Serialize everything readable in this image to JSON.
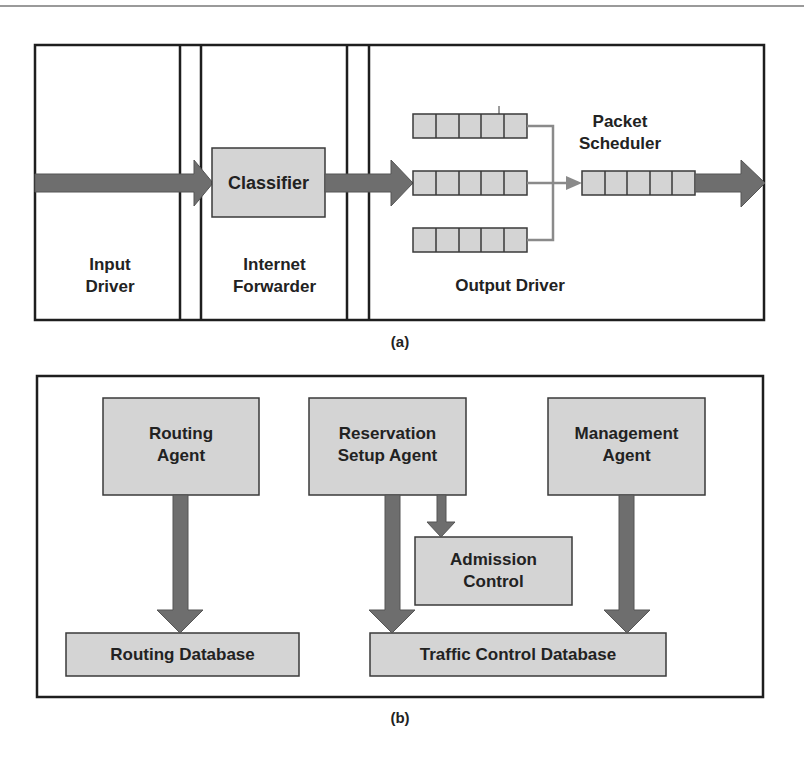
{
  "figure": {
    "colors": {
      "border": "#1e1e1e",
      "box_fill": "#d4d4d4",
      "arrow_fill": "#6e6e6e",
      "thin_arrow": "#8a8a8a",
      "text": "#222222"
    },
    "panel_a": {
      "caption": "(a)",
      "sections": {
        "input_driver": "Input\nDriver",
        "internet_forwarder": "Internet\nForwarder",
        "output_driver": "Output Driver"
      },
      "classifier": "Classifier",
      "packet_scheduler": "Packet\nScheduler",
      "queues": {
        "input_queue_count": 3,
        "cells_per_queue": 5,
        "output_queue_cells": 5
      }
    },
    "panel_b": {
      "caption": "(b)",
      "agents": [
        {
          "id": "routing-agent",
          "label": "Routing\nAgent"
        },
        {
          "id": "reservation-setup-agent",
          "label": "Reservation\nSetup Agent"
        },
        {
          "id": "management-agent",
          "label": "Management\nAgent"
        }
      ],
      "admission_control": "Admission\nControl",
      "databases": [
        {
          "id": "routing-database",
          "label": "Routing Database"
        },
        {
          "id": "traffic-control-database",
          "label": "Traffic Control Database"
        }
      ]
    }
  }
}
